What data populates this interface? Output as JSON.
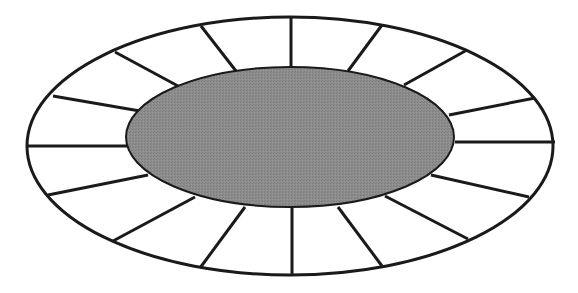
{
  "diagram": {
    "title": "Oval table seating arrangement",
    "table": {
      "label": "Table",
      "fill": "#8c8c8c",
      "cx": 290,
      "cy": 137,
      "rx": 164,
      "ry": 70
    },
    "outer_ring": {
      "cx": 290,
      "cy": 146,
      "rx": 263,
      "ry": 129,
      "fill": "#ffffff",
      "stroke": "#1a1a1a"
    },
    "seat_count": 16,
    "stroke_color": "#1a1a1a",
    "spokes": [
      {
        "x1": 27,
        "y1": 146,
        "x2": 128,
        "y2": 146
      },
      {
        "x1": 53,
        "y1": 96,
        "x2": 140,
        "y2": 111
      },
      {
        "x1": 115,
        "y1": 52,
        "x2": 178,
        "y2": 86
      },
      {
        "x1": 201,
        "y1": 26,
        "x2": 236,
        "y2": 71
      },
      {
        "x1": 291,
        "y1": 17,
        "x2": 291,
        "y2": 67
      },
      {
        "x1": 382,
        "y1": 25,
        "x2": 348,
        "y2": 71
      },
      {
        "x1": 467,
        "y1": 50,
        "x2": 404,
        "y2": 85
      },
      {
        "x1": 535,
        "y1": 98,
        "x2": 449,
        "y2": 115
      },
      {
        "x1": 555,
        "y1": 142,
        "x2": 455,
        "y2": 142
      },
      {
        "x1": 529,
        "y1": 197,
        "x2": 431,
        "y2": 175
      },
      {
        "x1": 468,
        "y1": 239,
        "x2": 385,
        "y2": 196
      },
      {
        "x1": 382,
        "y1": 266,
        "x2": 338,
        "y2": 207
      },
      {
        "x1": 292,
        "y1": 275,
        "x2": 292,
        "y2": 208
      },
      {
        "x1": 200,
        "y1": 268,
        "x2": 245,
        "y2": 207
      },
      {
        "x1": 113,
        "y1": 241,
        "x2": 195,
        "y2": 197
      },
      {
        "x1": 48,
        "y1": 195,
        "x2": 148,
        "y2": 175
      }
    ]
  }
}
